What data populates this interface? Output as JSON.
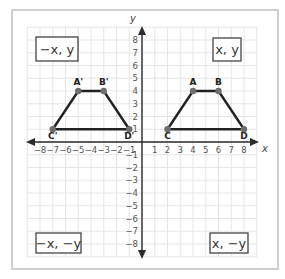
{
  "diagram": {
    "type": "coordinate-plane-reflection",
    "axes": {
      "x_label": "x",
      "y_label": "y",
      "x_ticks": [
        "-8",
        "-7",
        "-6",
        "-5",
        "-4",
        "-3",
        "-2",
        "-1",
        "1",
        "2",
        "3",
        "4",
        "5",
        "6",
        "7",
        "8"
      ],
      "y_ticks": [
        "8",
        "7",
        "6",
        "5",
        "4",
        "3",
        "2",
        "1",
        "-1",
        "-2",
        "-3",
        "-4",
        "-5",
        "-6",
        "-7",
        "-8"
      ],
      "range": [
        -8,
        8
      ]
    },
    "quadrant_labels": {
      "q1": "x, y",
      "q2": "−x, y",
      "q3": "−x, −y",
      "q4": "x, −y"
    },
    "figures": [
      {
        "name": "ABCD",
        "points": [
          {
            "label": "A",
            "x": 4,
            "y": 4
          },
          {
            "label": "B",
            "x": 6,
            "y": 4
          },
          {
            "label": "D",
            "x": 8,
            "y": 1
          },
          {
            "label": "C",
            "x": 2,
            "y": 1
          }
        ]
      },
      {
        "name": "A'B'C'D'",
        "points": [
          {
            "label": "A'",
            "x": -5,
            "y": 4
          },
          {
            "label": "B'",
            "x": -3,
            "y": 4
          },
          {
            "label": "D'",
            "x": -1,
            "y": 1
          },
          {
            "label": "C'",
            "x": -7,
            "y": 1
          }
        ]
      }
    ],
    "colors": {
      "frame": "#cfcfcf",
      "grid": "#e2e2e2",
      "axis": "#2b2b2b",
      "shape": "#222222",
      "point": "#6e6e6e"
    }
  }
}
